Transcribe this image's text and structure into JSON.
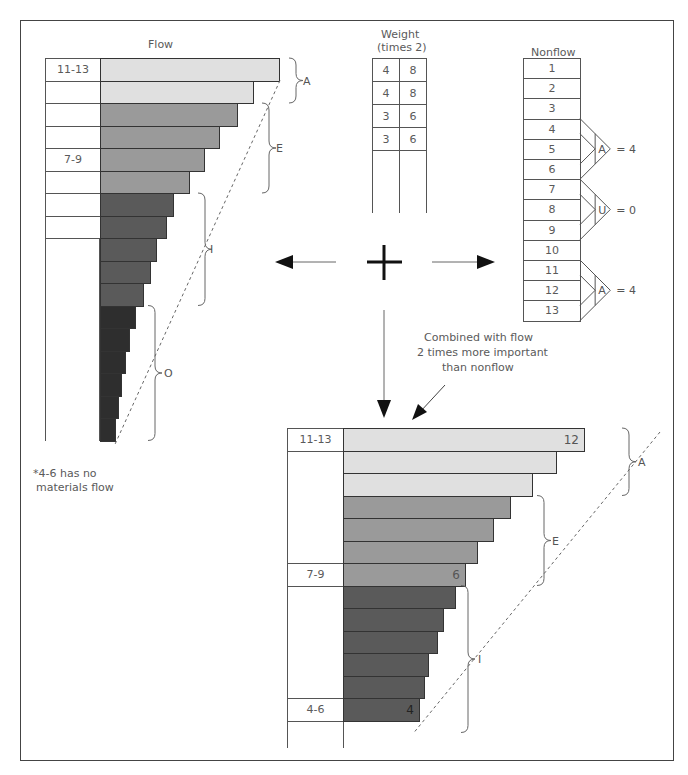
{
  "colors": {
    "A": "#e0e0e0",
    "E": "#9a9a9a",
    "I": "#5a5a5a",
    "O": "#2e2e2e",
    "frame": "#444444"
  },
  "flow": {
    "title": "Flow",
    "row_labels": [
      {
        "row": 0,
        "text": "11-13"
      },
      {
        "row": 4,
        "text": "7-9"
      }
    ],
    "groups": [
      {
        "label": "A",
        "rows": [
          0,
          1
        ]
      },
      {
        "label": "E",
        "rows": [
          2,
          3,
          4,
          5
        ]
      },
      {
        "label": "I",
        "rows": [
          6,
          7,
          8,
          9,
          10
        ]
      },
      {
        "label": "O",
        "rows": [
          11,
          12,
          13,
          14,
          15,
          16
        ]
      }
    ],
    "footnote_line1": "*4-6 has no",
    "footnote_line2": "materials flow"
  },
  "weight": {
    "title_line1": "Weight",
    "title_line2": "(times 2)",
    "rows": [
      {
        "weight": "4",
        "times2": "8"
      },
      {
        "weight": "4",
        "times2": "8"
      },
      {
        "weight": "3",
        "times2": "6"
      },
      {
        "weight": "3",
        "times2": "6"
      }
    ]
  },
  "nonflow": {
    "title": "Nonflow",
    "items": [
      "1",
      "2",
      "3",
      "4",
      "5",
      "6",
      "7",
      "8",
      "9",
      "10",
      "11",
      "12",
      "13"
    ],
    "ratings": [
      {
        "rows": "4-6",
        "letter": "A",
        "result": "= 4"
      },
      {
        "rows": "7-9",
        "letter": "U",
        "result": "= 0"
      },
      {
        "rows": "11-13",
        "letter": "A",
        "result": "= 4"
      }
    ]
  },
  "operator": {
    "plus": "+",
    "annotation_line1": "Combined with flow",
    "annotation_line2": "2 times more important",
    "annotation_line3": "than nonflow"
  },
  "combined": {
    "row_labels": [
      {
        "row": 0,
        "text": "11-13"
      },
      {
        "row": 6,
        "text": "7-9"
      },
      {
        "row": 12,
        "text": "4-6"
      }
    ],
    "bar_values": [
      {
        "row": 0,
        "text": "12"
      },
      {
        "row": 6,
        "text": "6"
      },
      {
        "row": 12,
        "text": "4"
      }
    ],
    "groups": [
      {
        "label": "A",
        "rows": [
          0,
          1,
          2
        ]
      },
      {
        "label": "E",
        "rows": [
          3,
          4,
          5,
          6
        ]
      },
      {
        "label": "I",
        "rows": [
          7,
          8,
          9,
          10,
          11,
          12
        ]
      }
    ]
  },
  "chart_data": [
    {
      "type": "bar",
      "title": "Flow",
      "orientation": "horizontal",
      "categories": [
        "r1",
        "r2",
        "r3",
        "r4",
        "r5",
        "r6",
        "r7",
        "r8",
        "r9",
        "r10",
        "r11",
        "r12",
        "r13",
        "r14",
        "r15",
        "r16",
        "r17"
      ],
      "values": [
        180,
        154,
        138,
        120,
        105,
        90,
        74,
        67,
        57,
        51,
        44,
        36,
        30,
        26,
        22,
        19,
        16
      ],
      "row_labels": {
        "r1": "11-13",
        "r5": "7-9"
      },
      "groups": {
        "A": [
          1,
          2
        ],
        "E": [
          3,
          4,
          5,
          6
        ],
        "I": [
          7,
          8,
          9,
          10,
          11
        ],
        "O": [
          12,
          13,
          14,
          15,
          16,
          17
        ]
      },
      "xlabel": "",
      "ylabel": ""
    },
    {
      "type": "table",
      "title": "Weight (times 2)",
      "columns": [
        "Weight",
        "Times 2"
      ],
      "rows": [
        [
          "4",
          "8"
        ],
        [
          "4",
          "8"
        ],
        [
          "3",
          "6"
        ],
        [
          "3",
          "6"
        ]
      ]
    },
    {
      "type": "table",
      "title": "Nonflow",
      "rows": [
        "1",
        "2",
        "3",
        "4",
        "5",
        "6",
        "7",
        "8",
        "9",
        "10",
        "11",
        "12",
        "13"
      ],
      "ratings": [
        {
          "rows": "4-6",
          "rating": "A",
          "value": 4
        },
        {
          "rows": "7-9",
          "rating": "U",
          "value": 0
        },
        {
          "rows": "11-13",
          "rating": "A",
          "value": 4
        }
      ]
    },
    {
      "type": "bar",
      "title": "Combined with flow 2 times more important than nonflow",
      "orientation": "horizontal",
      "categories": [
        "r1",
        "r2",
        "r3",
        "r4",
        "r5",
        "r6",
        "r7",
        "r8",
        "r9",
        "r10",
        "r11",
        "r12",
        "r13"
      ],
      "values": [
        242,
        214,
        190,
        168,
        151,
        135,
        123,
        113,
        101,
        95,
        86,
        82,
        77
      ],
      "value_labels": {
        "r1": "12",
        "r7": "6",
        "r13": "4"
      },
      "row_labels": {
        "r1": "11-13",
        "r7": "7-9",
        "r13": "4-6"
      },
      "groups": {
        "A": [
          1,
          2,
          3
        ],
        "E": [
          4,
          5,
          6,
          7
        ],
        "I": [
          8,
          9,
          10,
          11,
          12,
          13
        ]
      },
      "xlabel": "",
      "ylabel": ""
    }
  ]
}
